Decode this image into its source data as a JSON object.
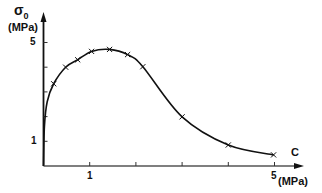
{
  "chart_data": {
    "type": "line",
    "title": "",
    "xlabel": "C",
    "xunit": "(MPa)",
    "ylabel": "σ",
    "ylabel_sub": "0",
    "yunit": "(MPa)",
    "x_ticks_labeled": [
      "1",
      "5"
    ],
    "y_ticks_labeled": [
      "1",
      "5"
    ],
    "xlim": [
      0,
      5.5
    ],
    "ylim": [
      0,
      5.5
    ],
    "grid": false,
    "legend": null,
    "series": [
      {
        "name": "σ0 vs C",
        "marker": "x",
        "smooth": true,
        "x": [
          0.22,
          0.48,
          0.74,
          1.04,
          1.43,
          1.82,
          2.15,
          3.0,
          4.0,
          4.98
        ],
        "y": [
          3.33,
          4.0,
          4.3,
          4.64,
          4.72,
          4.51,
          4.02,
          1.99,
          0.85,
          0.45
        ]
      }
    ],
    "curve_start": {
      "x": 0.0,
      "y": 0.0
    }
  },
  "labels": {
    "y_symbol": "σ",
    "y_subscript": "0",
    "y_unit": "(MPa)",
    "x_symbol": "C",
    "x_unit": "(MPa)",
    "y_tick_5": "5",
    "y_tick_1": "1",
    "x_tick_1": "1",
    "x_tick_5": "5"
  }
}
